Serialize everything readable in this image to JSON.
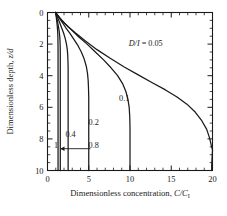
{
  "chart_data": {
    "type": "line",
    "title": "",
    "xlabel": "Dimensionless concentration, C/C",
    "xlabel_sub": "I",
    "ylabel": "Dimensionless depth, z/d",
    "xlim": [
      0,
      20
    ],
    "ylim": [
      10,
      0
    ],
    "y_axis_inverted": true,
    "grid": false,
    "legend": "inline-annotations",
    "x_ticks_major": [
      0,
      5,
      10,
      15,
      20
    ],
    "x_tick_labels": [
      "0",
      "5",
      "10",
      "15",
      "20"
    ],
    "x_minor_interval": 1,
    "y_ticks_major": [
      0,
      2,
      4,
      6,
      8,
      10
    ],
    "y_tick_labels": [
      "0",
      "2",
      "4",
      "6",
      "8",
      "10"
    ],
    "y_minor_interval": 0.5,
    "series_parameter_name": "D/I",
    "annotations": [
      {
        "text": "D/I = 0.05",
        "x": 11.9,
        "y": 2.15,
        "italic_prefix": "D/I",
        "rest": " = 0.05"
      },
      {
        "text": "0.1",
        "x": 9.3,
        "y": 5.6
      },
      {
        "text": "0.2",
        "x": 5.6,
        "y": 7.1
      },
      {
        "text": "0.4",
        "x": 2.8,
        "y": 7.9
      },
      {
        "text": "0.8",
        "x": 5.6,
        "y": 8.55
      },
      {
        "text": "1",
        "x": 1.05,
        "y": 8.55
      }
    ],
    "arrow": {
      "from_x": 5.2,
      "from_y": 8.62,
      "to_x": 1.55,
      "to_y": 8.62,
      "direction": "left"
    },
    "series": [
      {
        "name": "0.05",
        "value": 0.05,
        "asymptote_x": 20,
        "points": [
          [
            1.0,
            0.0
          ],
          [
            1.6,
            0.42
          ],
          [
            2.4,
            0.85
          ],
          [
            3.4,
            1.3
          ],
          [
            4.6,
            1.8
          ],
          [
            6.0,
            2.35
          ],
          [
            7.6,
            2.9
          ],
          [
            9.3,
            3.45
          ],
          [
            11.0,
            3.95
          ],
          [
            12.7,
            4.45
          ],
          [
            14.3,
            4.9
          ],
          [
            15.7,
            5.35
          ],
          [
            16.9,
            5.8
          ],
          [
            17.9,
            6.3
          ],
          [
            18.7,
            6.85
          ],
          [
            19.3,
            7.4
          ],
          [
            19.65,
            7.95
          ],
          [
            19.85,
            8.4
          ],
          [
            20.0,
            8.7
          ],
          [
            19.95,
            9.2
          ],
          [
            19.9,
            9.7
          ],
          [
            19.9,
            10.0
          ]
        ]
      },
      {
        "name": "0.1",
        "value": 0.1,
        "asymptote_x": 10,
        "points": [
          [
            1.0,
            0.0
          ],
          [
            1.5,
            0.35
          ],
          [
            2.1,
            0.7
          ],
          [
            2.9,
            1.1
          ],
          [
            3.8,
            1.55
          ],
          [
            4.8,
            2.0
          ],
          [
            5.8,
            2.5
          ],
          [
            6.8,
            3.0
          ],
          [
            7.7,
            3.5
          ],
          [
            8.5,
            4.0
          ],
          [
            9.1,
            4.5
          ],
          [
            9.5,
            5.0
          ],
          [
            9.75,
            5.5
          ],
          [
            9.9,
            6.0
          ],
          [
            9.97,
            6.6
          ],
          [
            10.0,
            7.3
          ],
          [
            10.0,
            8.5
          ],
          [
            10.0,
            10.0
          ]
        ]
      },
      {
        "name": "0.2",
        "value": 0.2,
        "asymptote_x": 5,
        "points": [
          [
            1.0,
            0.0
          ],
          [
            1.35,
            0.3
          ],
          [
            1.75,
            0.6
          ],
          [
            2.2,
            0.95
          ],
          [
            2.7,
            1.3
          ],
          [
            3.2,
            1.7
          ],
          [
            3.7,
            2.1
          ],
          [
            4.1,
            2.5
          ],
          [
            4.45,
            2.95
          ],
          [
            4.7,
            3.4
          ],
          [
            4.85,
            3.85
          ],
          [
            4.93,
            4.3
          ],
          [
            4.97,
            4.8
          ],
          [
            5.0,
            5.4
          ],
          [
            5.0,
            6.5
          ],
          [
            5.0,
            8.0
          ],
          [
            5.0,
            10.0
          ]
        ]
      },
      {
        "name": "0.4",
        "value": 0.4,
        "asymptote_x": 2.5,
        "points": [
          [
            1.0,
            0.0
          ],
          [
            1.2,
            0.3
          ],
          [
            1.45,
            0.6
          ],
          [
            1.7,
            0.95
          ],
          [
            1.95,
            1.3
          ],
          [
            2.15,
            1.65
          ],
          [
            2.3,
            2.0
          ],
          [
            2.4,
            2.35
          ],
          [
            2.45,
            2.7
          ],
          [
            2.48,
            3.05
          ],
          [
            2.5,
            3.5
          ],
          [
            2.5,
            4.5
          ],
          [
            2.5,
            6.0
          ],
          [
            2.5,
            8.0
          ],
          [
            2.5,
            10.0
          ]
        ]
      },
      {
        "name": "0.8",
        "value": 0.8,
        "asymptote_x": 1.55,
        "points": [
          [
            1.0,
            0.0
          ],
          [
            1.1,
            0.3
          ],
          [
            1.22,
            0.6
          ],
          [
            1.33,
            0.9
          ],
          [
            1.42,
            1.2
          ],
          [
            1.48,
            1.5
          ],
          [
            1.52,
            1.85
          ],
          [
            1.54,
            2.2
          ],
          [
            1.55,
            2.7
          ],
          [
            1.55,
            3.5
          ],
          [
            1.55,
            5.0
          ],
          [
            1.55,
            7.0
          ],
          [
            1.55,
            10.0
          ]
        ]
      },
      {
        "name": "1",
        "value": 1.0,
        "asymptote_x": 1.28,
        "points": [
          [
            1.0,
            0.0
          ],
          [
            1.06,
            0.3
          ],
          [
            1.13,
            0.6
          ],
          [
            1.19,
            0.9
          ],
          [
            1.23,
            1.2
          ],
          [
            1.26,
            1.55
          ],
          [
            1.27,
            1.9
          ],
          [
            1.28,
            2.4
          ],
          [
            1.28,
            3.2
          ],
          [
            1.28,
            4.5
          ],
          [
            1.28,
            6.5
          ],
          [
            1.28,
            10.0
          ]
        ]
      }
    ]
  },
  "figure": {
    "axis_color": "#1a1a1a",
    "curve_color": "#1a1a1a",
    "background": "#ffffff"
  }
}
